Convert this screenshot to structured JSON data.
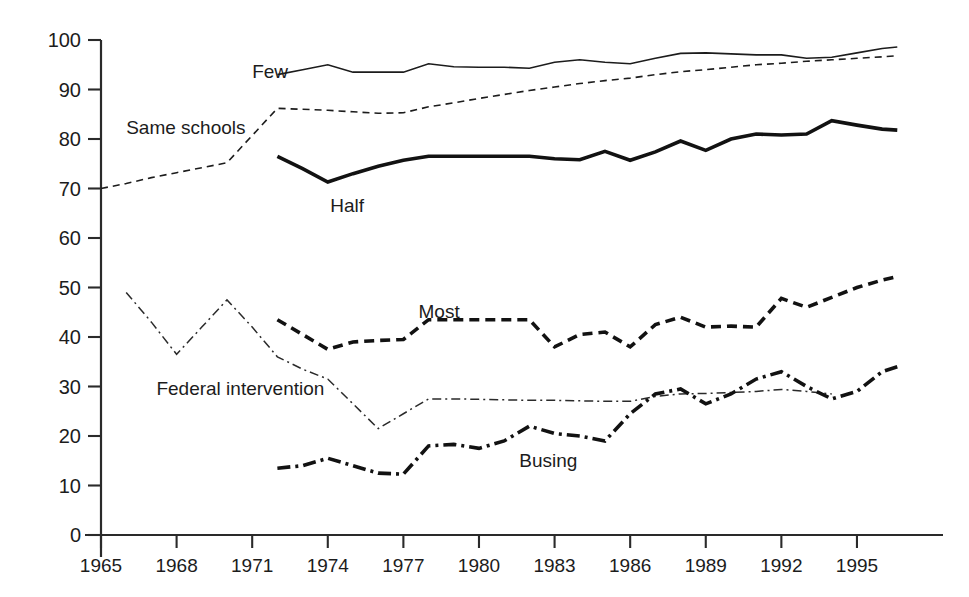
{
  "chart_data": {
    "type": "line",
    "title": "",
    "subtitle": "",
    "xlabel": "",
    "ylabel": "",
    "xlim": [
      1965,
      1997.7
    ],
    "ylim": [
      0,
      100
    ],
    "grid": false,
    "legend_position": "inline-labels",
    "x_ticks": [
      1965,
      1968,
      1971,
      1974,
      1977,
      1980,
      1983,
      1986,
      1989,
      1992,
      1995
    ],
    "x_tick_labels": [
      "1965",
      "1968",
      "1971",
      "1974",
      "1977",
      "1980",
      "1983",
      "1986",
      "1989",
      "1992",
      "1995"
    ],
    "y_ticks": [
      0,
      10,
      20,
      30,
      40,
      50,
      60,
      70,
      80,
      90,
      100
    ],
    "y_tick_labels": [
      "0",
      "10",
      "20",
      "30",
      "40",
      "50",
      "60",
      "70",
      "80",
      "90",
      "100"
    ],
    "series": [
      {
        "name": "Few",
        "label": "Few",
        "style": "solid-thin",
        "color": "#1c1c1c",
        "width": 1.6,
        "dash": "none",
        "label_x": 1971.0,
        "label_y": 93.6,
        "x": [
          1972,
          1973,
          1974,
          1975,
          1976,
          1977,
          1978,
          1979,
          1980,
          1981,
          1982,
          1983,
          1984,
          1985,
          1986,
          1987,
          1988,
          1989,
          1990,
          1991,
          1992,
          1993,
          1994,
          1995,
          1996,
          1996.6
        ],
        "y": [
          93.0,
          94.0,
          95.0,
          93.5,
          93.5,
          93.5,
          95.2,
          94.6,
          94.5,
          94.5,
          94.3,
          95.5,
          96.0,
          95.5,
          95.2,
          96.3,
          97.3,
          97.4,
          97.2,
          97.0,
          97.0,
          96.3,
          96.5,
          97.4,
          98.3,
          98.6
        ]
      },
      {
        "name": "Same schools",
        "label": "Same schools",
        "style": "dashed-thin",
        "color": "#1c1c1c",
        "width": 1.6,
        "dash": "7,5",
        "label_x": 1966.0,
        "label_y": 82.2,
        "x": [
          1965,
          1966,
          1967,
          1968,
          1969,
          1970,
          1972,
          1973,
          1974,
          1975,
          1976,
          1977,
          1978,
          1979,
          1980,
          1981,
          1982,
          1983,
          1984,
          1985,
          1986,
          1987,
          1988,
          1989,
          1990,
          1991,
          1992,
          1993,
          1994,
          1995,
          1996,
          1996.6
        ],
        "y": [
          70.0,
          71.0,
          72.2,
          73.2,
          74.2,
          75.2,
          86.2,
          86.0,
          85.8,
          85.5,
          85.2,
          85.3,
          86.5,
          87.3,
          88.2,
          89.0,
          89.8,
          90.5,
          91.2,
          91.8,
          92.3,
          93.0,
          93.6,
          94.0,
          94.5,
          95.0,
          95.3,
          95.7,
          96.0,
          96.3,
          96.6,
          96.8
        ]
      },
      {
        "name": "Half",
        "label": "Half",
        "style": "solid-thick",
        "color": "#121212",
        "width": 3.6,
        "dash": "none",
        "label_x": 1974.1,
        "label_y": 66.5,
        "x": [
          1972,
          1973,
          1974,
          1975,
          1976,
          1977,
          1978,
          1979,
          1980,
          1981,
          1982,
          1983,
          1984,
          1985,
          1986,
          1987,
          1988,
          1989,
          1990,
          1991,
          1992,
          1993,
          1994,
          1995,
          1996,
          1996.6
        ],
        "y": [
          76.5,
          74.0,
          71.3,
          73.0,
          74.5,
          75.7,
          76.5,
          76.5,
          76.5,
          76.5,
          76.5,
          76.0,
          75.8,
          77.5,
          75.7,
          77.4,
          79.6,
          77.7,
          80.0,
          81.0,
          80.8,
          81.0,
          83.7,
          82.8,
          82.0,
          81.8
        ]
      },
      {
        "name": "Most",
        "label": "Most",
        "style": "dashed-thick",
        "color": "#121212",
        "width": 3.6,
        "dash": "10,6",
        "label_x": 1977.6,
        "label_y": 45.0,
        "x": [
          1972,
          1973,
          1974,
          1975,
          1976,
          1977,
          1978,
          1979,
          1980,
          1981,
          1982,
          1983,
          1984,
          1985,
          1986,
          1987,
          1988,
          1989,
          1990,
          1991,
          1992,
          1993,
          1994,
          1995,
          1996,
          1996.6
        ],
        "y": [
          43.5,
          40.5,
          37.5,
          39.0,
          39.3,
          39.5,
          43.5,
          43.5,
          43.5,
          43.5,
          43.5,
          38.0,
          40.5,
          41.0,
          38.0,
          42.5,
          44.0,
          42.0,
          42.2,
          42.0,
          47.8,
          46.0,
          48.0,
          50.0,
          51.5,
          52.2
        ]
      },
      {
        "name": "Federal intervention",
        "label": "Federal intervention",
        "style": "dashdot-thin",
        "color": "#2a2a2a",
        "width": 1.5,
        "dash": "9,4,2,4",
        "label_x": 1967.2,
        "label_y": 29.5,
        "x": [
          1966,
          1967,
          1968,
          1969,
          1970,
          1971,
          1972,
          1973,
          1974,
          1975,
          1976,
          1977,
          1978,
          1979,
          1980,
          1981,
          1982,
          1983,
          1984,
          1985,
          1986,
          1987,
          1988,
          1989,
          1990,
          1991,
          1992,
          1993,
          1994
        ],
        "y": [
          49.0,
          43.0,
          36.5,
          42.0,
          47.5,
          42.0,
          36.0,
          33.5,
          31.5,
          26.5,
          21.5,
          24.5,
          27.5,
          27.5,
          27.4,
          27.3,
          27.2,
          27.2,
          27.1,
          27.0,
          27.0,
          28.0,
          28.5,
          28.6,
          28.8,
          29.0,
          29.4,
          29.0,
          28.5
        ]
      },
      {
        "name": "Busing",
        "label": "Busing",
        "style": "dashdot-thick",
        "color": "#121212",
        "width": 3.6,
        "dash": "13,5,3,5",
        "label_x": 1981.6,
        "label_y": 15.0,
        "x": [
          1972,
          1973,
          1974,
          1975,
          1976,
          1977,
          1978,
          1979,
          1980,
          1981,
          1982,
          1983,
          1984,
          1985,
          1986,
          1987,
          1988,
          1989,
          1990,
          1991,
          1992,
          1993,
          1994,
          1995,
          1996,
          1996.6
        ],
        "y": [
          13.5,
          14.0,
          15.5,
          14.0,
          12.5,
          12.3,
          18.0,
          18.3,
          17.5,
          19.0,
          22.0,
          20.5,
          20.0,
          19.0,
          24.5,
          28.5,
          29.5,
          26.5,
          28.5,
          31.5,
          33.0,
          30.0,
          27.5,
          29.0,
          33.0,
          34.0
        ]
      }
    ]
  }
}
